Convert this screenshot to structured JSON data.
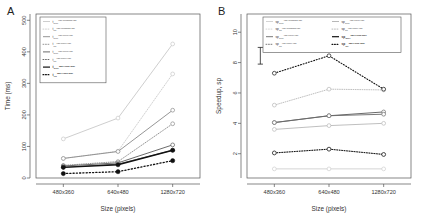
{
  "figure": {
    "panels": [
      {
        "letter": "A",
        "chart_index": 0
      },
      {
        "letter": "B",
        "chart_index": 1
      }
    ]
  },
  "chart_data": [
    {
      "type": "line",
      "title": "",
      "xlabel": "Size (pixels)",
      "ylabel": "Time (ms)",
      "categories": [
        "480x360",
        "640x480",
        "1280x720"
      ],
      "xticklabels": [
        "480x360",
        "640x480",
        "1280x720"
      ],
      "yticklabels": [
        "0",
        "100",
        "200",
        "300",
        "400",
        "500"
      ],
      "yticks": [
        0,
        100,
        200,
        300,
        400,
        500
      ],
      "ylim": [
        0,
        520
      ],
      "grid": false,
      "legend_position": "top-left",
      "series": [
        {
          "name": "t_over^x86-Windows-x86",
          "sym": "t",
          "sub": "over",
          "sup": "x86-Windows-x86",
          "values": [
            124,
            190,
            425
          ],
          "color": "#c8c8c8",
          "dash": "solid",
          "marker": "open",
          "width": 0.9
        },
        {
          "name": "t_ref^x86-Windows-x86",
          "sym": "t",
          "sub": "ref",
          "sup": "x86-Windows-x86",
          "values": [
            62,
            85,
            330
          ],
          "color": "#c8c8c8",
          "dash": "dotted",
          "marker": "open",
          "width": 0.9
        },
        {
          "name": "t_over^x86-Linux-x86",
          "sym": "t",
          "sub": "over",
          "sup": "x86-Linux-x86",
          "values": [
            62,
            84,
            215
          ],
          "color": "#8a8a8a",
          "dash": "solid",
          "marker": "open",
          "width": 0.9
        },
        {
          "name": "t_ref^x86-Linux-x86",
          "sym": "t",
          "sub": "ref",
          "sup": "x86-Linux-x86",
          "values": [
            40,
            52,
            172
          ],
          "color": "#8a8a8a",
          "dash": "dotted",
          "marker": "open",
          "width": 0.9
        },
        {
          "name": "t_over^x86-Linux-x86b",
          "sym": "t",
          "sub": "over",
          "sup": "x86-Linux-x86",
          "values": [
            38,
            48,
            105
          ],
          "color": "#5a5a5a",
          "dash": "solid",
          "marker": "open",
          "width": 0.9
        },
        {
          "name": "t_ref^x86-Linux-x86b",
          "sym": "t",
          "sub": "ref",
          "sup": "x86-Linux-x86",
          "values": [
            34,
            44,
            88
          ],
          "color": "#5a5a5a",
          "dash": "solid",
          "marker": "open",
          "width": 0.9
        },
        {
          "name": "t_over^x86-Linux-mac",
          "sym": "t",
          "sub": "over",
          "sup": "x86-Linux-mac",
          "values": [
            34,
            42,
            88
          ],
          "color": "#111111",
          "dash": "solid",
          "marker": "filled",
          "width": 1.3
        },
        {
          "name": "t_ref^x86-Linux-mac",
          "sym": "t",
          "sub": "ref",
          "sup": "x86-Linux-mac",
          "values": [
            14,
            20,
            55
          ],
          "color": "#111111",
          "dash": "dotted",
          "marker": "filled",
          "width": 1.3
        }
      ]
    },
    {
      "type": "line",
      "title": "",
      "xlabel": "Size (pixels)",
      "ylabel": "Speedup, sp",
      "categories": [
        "480x360",
        "640x480",
        "1280x720"
      ],
      "xticklabels": [
        "480x360",
        "640x480",
        "1280x720"
      ],
      "yticklabels": [
        "2",
        "4",
        "6",
        "8",
        "10"
      ],
      "yticks": [
        2,
        4,
        6,
        8,
        10
      ],
      "ylim": [
        0.4,
        11.2
      ],
      "grid": false,
      "legend_position": "top",
      "errorbar": {
        "x_category": "480x360",
        "low": 7.9,
        "high": 9.0,
        "center": 8.45
      },
      "series": [
        {
          "name": "sp_over^x86-Windows-x86",
          "sym": "sp",
          "sub": "over",
          "sup": "x86-Windows-x86",
          "values": [
            1.0,
            1.0,
            1.0
          ],
          "color": "#cfcfcf",
          "dash": "solid",
          "marker": "open",
          "width": 0.9
        },
        {
          "name": "sp_ref^x86-Windows-x86",
          "sym": "sp",
          "sub": "ref",
          "sup": "x86-Windows-x86",
          "values": [
            2.05,
            2.3,
            1.95
          ],
          "color": "#b0b0b0",
          "dash": "dotted",
          "marker": "open",
          "width": 0.9
        },
        {
          "name": "sp_over^x86-Linux-x86L",
          "sym": "sp",
          "sub": "over",
          "sup": "x86-Linux-x86",
          "values": [
            3.6,
            3.85,
            4.0
          ],
          "color": "#b8b8b8",
          "dash": "solid",
          "marker": "open",
          "width": 0.9
        },
        {
          "name": "sp_ref^x86-Linux-x86L",
          "sym": "sp",
          "sub": "ref",
          "sup": "x86-Linux-x86",
          "values": [
            5.2,
            6.25,
            6.2
          ],
          "color": "#b8b8b8",
          "dash": "dotted",
          "marker": "open",
          "width": 0.9
        },
        {
          "name": "sp_over^x86-Linux-x86R",
          "sym": "sp",
          "sub": "over",
          "sup": "x86-Linux-x86",
          "values": [
            4.05,
            4.5,
            4.75
          ],
          "color": "#6a6a6a",
          "dash": "solid",
          "marker": "open",
          "width": 1.0
        },
        {
          "name": "sp_ref^x86-Linux-x86R",
          "sym": "sp",
          "sub": "ref",
          "sup": "x86-Linux-x86",
          "values": [
            4.05,
            4.5,
            4.6
          ],
          "color": "#6a6a6a",
          "dash": "solid",
          "marker": "open",
          "width": 0.9
        },
        {
          "name": "sp_over^x86-Linux-mac",
          "sym": "sp",
          "sub": "over",
          "sup": "x86-Linux-mac",
          "values": [
            7.3,
            8.45,
            6.25
          ],
          "color": "#111111",
          "dash": "dotted",
          "marker": "open",
          "width": 1.1
        },
        {
          "name": "sp_ref^x86-Linux-mac",
          "sym": "sp",
          "sub": "ref",
          "sup": "x86-Linux-mac",
          "values": [
            2.05,
            2.3,
            1.95
          ],
          "color": "#111111",
          "dash": "dotted",
          "marker": "open",
          "width": 1.0
        }
      ]
    }
  ],
  "legends": [
    {
      "panel": "A",
      "columns": 1,
      "entries": [
        {
          "sym": "t",
          "sub": "over",
          "sup": "x86-Windows-x86",
          "color": "#c8c8c8",
          "dash": "solid"
        },
        {
          "sym": "t",
          "sub": "ref",
          "sup": "x86-Windows-x86",
          "color": "#c8c8c8",
          "dash": "dotted"
        },
        {
          "sym": "t",
          "sub": "over",
          "sup": "x86-Linux-x86",
          "color": "#8a8a8a",
          "dash": "solid"
        },
        {
          "sym": "t",
          "sub": "ref",
          "sup": "x86-Linux-x86",
          "color": "#8a8a8a",
          "dash": "dotted"
        },
        {
          "sym": "t",
          "sub": "over",
          "sup": "x86-Linux-x86",
          "color": "#5a5a5a",
          "dash": "solid"
        },
        {
          "sym": "t",
          "sub": "ref",
          "sup": "x86-Linux-x86",
          "color": "#5a5a5a",
          "dash": "dotted"
        },
        {
          "sym": "t",
          "sub": "over",
          "sup": "x86-Linux-mac",
          "color": "#111111",
          "dash": "solid"
        },
        {
          "sym": "t",
          "sub": "ref",
          "sup": "x86-Linux-mac",
          "color": "#111111",
          "dash": "dotted"
        }
      ]
    },
    {
      "panel": "B",
      "columns": 2,
      "entries": [
        {
          "sym": "sp",
          "sub": "over",
          "sup": "x86-Windows-x86",
          "color": "#cfcfcf",
          "dash": "solid"
        },
        {
          "sym": "sp",
          "sub": "over",
          "sup": "x86-Linux-x86",
          "color": "#b0b0b0",
          "dash": "solid"
        },
        {
          "sym": "sp",
          "sub": "ref",
          "sup": "x86-Windows-x86",
          "color": "#cfcfcf",
          "dash": "dotted"
        },
        {
          "sym": "sp",
          "sub": "ref",
          "sup": "x86-Linux-x86",
          "color": "#b0b0b0",
          "dash": "dotted"
        },
        {
          "sym": "sp",
          "sub": "over",
          "sup": "x86-Linux-x86",
          "color": "#6a6a6a",
          "dash": "solid"
        },
        {
          "sym": "sp",
          "sub": "over",
          "sup": "x86-Linux-mac",
          "color": "#111111",
          "dash": "solid"
        },
        {
          "sym": "sp",
          "sub": "ref",
          "sup": "x86-Linux-x86",
          "color": "#6a6a6a",
          "dash": "dotted"
        },
        {
          "sym": "sp",
          "sub": "ref",
          "sup": "x86-Linux-mac",
          "color": "#111111",
          "dash": "dotted"
        }
      ]
    }
  ]
}
